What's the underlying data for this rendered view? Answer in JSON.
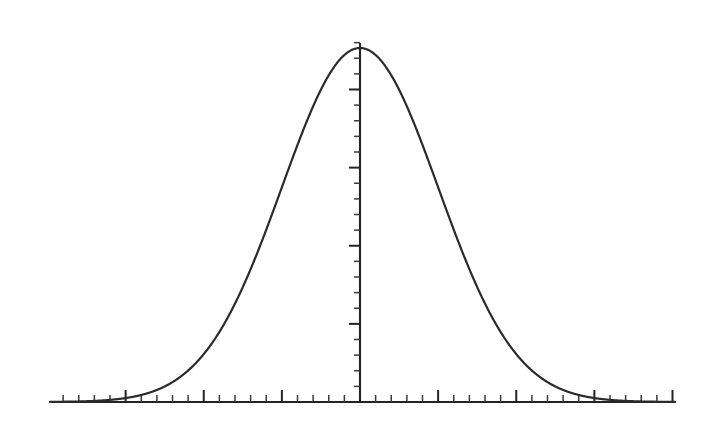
{
  "figure": {
    "title": "",
    "background_color": "#ffffff",
    "width": 715,
    "height": 447,
    "caption": ""
  },
  "chart_data": {
    "type": "line",
    "title": "",
    "subtitle": "",
    "xlabel": "",
    "ylabel": "",
    "annotations": [],
    "legend": {
      "entries": [],
      "position": "none",
      "visible": false
    },
    "grid": false,
    "description": "Symmetric bell-shaped normal (Gaussian) distribution curve centered on a vertical axis, drawn over a horizontal axis with major and minor tick marks.",
    "distribution": {
      "name": "normal",
      "mean": 0,
      "std_dev": 1,
      "peak_value": 1.0
    },
    "axes": {
      "x": {
        "min": -4,
        "max": 4,
        "origin": 0,
        "tick_labels": [],
        "major_tick_values": [
          -4,
          -3,
          -2,
          -1,
          0,
          1,
          2,
          3,
          4
        ],
        "minor_ticks_per_major": 5,
        "minor_tick_step": 0.2,
        "line_color": "#232323"
      },
      "y": {
        "min": 0,
        "max": 1.06,
        "tick_labels": [],
        "major_tick_values": [
          0,
          0.2,
          0.4,
          0.6,
          0.8,
          1.0
        ],
        "minor_ticks_per_major": 5,
        "minor_tick_step": 0.04,
        "tick_side": "left",
        "line_color": "#232323"
      }
    },
    "series": [
      {
        "name": "normal-curve",
        "color": "#2b2b2b",
        "line_width": 2.2,
        "x": [
          -4.0,
          -3.8,
          -3.6,
          -3.4,
          -3.2,
          -3.0,
          -2.8,
          -2.6,
          -2.4,
          -2.2,
          -2.0,
          -1.8,
          -1.6,
          -1.4,
          -1.2,
          -1.0,
          -0.8,
          -0.6,
          -0.4,
          -0.2,
          0.0,
          0.2,
          0.4,
          0.6,
          0.8,
          1.0,
          1.2,
          1.4,
          1.6,
          1.8,
          2.0,
          2.2,
          2.4,
          2.6,
          2.8,
          3.0,
          3.2,
          3.4,
          3.6,
          3.8,
          4.0
        ],
        "values": [
          0.0003,
          0.0007,
          0.0015,
          0.0032,
          0.0063,
          0.0111,
          0.0198,
          0.034,
          0.0561,
          0.0889,
          0.1353,
          0.1979,
          0.278,
          0.3753,
          0.4868,
          0.6065,
          0.7261,
          0.8353,
          0.9231,
          0.9802,
          1.0,
          0.9802,
          0.9231,
          0.8353,
          0.7261,
          0.6065,
          0.4868,
          0.3753,
          0.278,
          0.1979,
          0.1353,
          0.0889,
          0.0561,
          0.034,
          0.0198,
          0.0111,
          0.0063,
          0.0032,
          0.0015,
          0.0007,
          0.0003
        ]
      }
    ]
  },
  "geometry": {
    "x_axis_y_px": 402,
    "x_axis_left_px": 50,
    "x_axis_right_px": 675,
    "y_axis_x_px": 360,
    "y_axis_top_px": 43,
    "peak_y_px": 48,
    "major_tick_step_px": 78.125,
    "minor_tick_step_px": 15.625,
    "x_major_tick_len_px": 12,
    "x_minor_tick_len_px": 7,
    "y_major_tick_len_px": 11,
    "y_minor_tick_len_px": 6
  }
}
